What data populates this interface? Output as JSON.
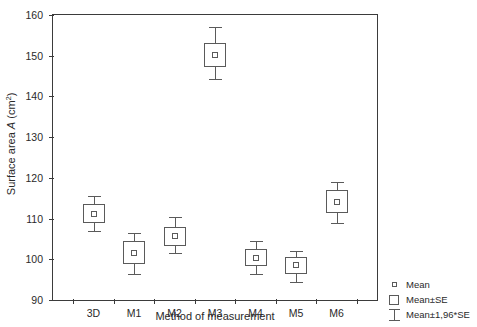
{
  "chart_data": {
    "type": "box",
    "title": "",
    "xlabel": "Method of measurement",
    "ylabel_prefix": "Surface area ",
    "ylabel_var": "A",
    "ylabel_unit": " (cm",
    "ylabel_sup": "2",
    "ylabel_suffix": ")",
    "ylabel_full": "Surface area A (cm2)",
    "categories": [
      "3D",
      "M1",
      "M2",
      "M3",
      "M4",
      "M5",
      "M6"
    ],
    "ylim": [
      90,
      160
    ],
    "yticks": [
      90,
      100,
      110,
      120,
      130,
      140,
      150,
      160
    ],
    "ytick_labels": [
      "90",
      "100",
      "110",
      "120",
      "130",
      "140",
      "150",
      "160"
    ],
    "grid": false,
    "legend_position": "outside-bottom-right",
    "series": [
      {
        "name": "3D",
        "mean": 111.2,
        "se_low": 108.8,
        "se_high": 113.5,
        "ci_low": 107.0,
        "ci_high": 115.5
      },
      {
        "name": "M1",
        "mean": 101.5,
        "se_low": 98.8,
        "se_high": 104.5,
        "ci_low": 96.3,
        "ci_high": 106.5
      },
      {
        "name": "M2",
        "mean": 105.8,
        "se_low": 103.3,
        "se_high": 108.0,
        "ci_low": 101.5,
        "ci_high": 110.3
      },
      {
        "name": "M3",
        "mean": 150.2,
        "se_low": 147.2,
        "se_high": 153.2,
        "ci_low": 144.2,
        "ci_high": 157.0
      },
      {
        "name": "M4",
        "mean": 100.2,
        "se_low": 98.3,
        "se_high": 102.5,
        "ci_low": 96.3,
        "ci_high": 104.5
      },
      {
        "name": "M5",
        "mean": 98.5,
        "se_low": 96.5,
        "se_high": 100.5,
        "ci_low": 94.5,
        "ci_high": 102.0
      },
      {
        "name": "M6",
        "mean": 114.0,
        "se_low": 111.3,
        "se_high": 117.0,
        "ci_low": 109.0,
        "ci_high": 119.0
      }
    ],
    "legend": [
      {
        "key": "mean-marker",
        "label": "Mean"
      },
      {
        "key": "se-box",
        "label": "Mean±SE"
      },
      {
        "key": "ci-whisker",
        "label": "Mean±1,96*SE"
      }
    ],
    "colors": {
      "axis": "#3b3b3b",
      "glyph": "#5a5a5a",
      "text": "#2a2a2a",
      "background": "#ffffff"
    }
  }
}
